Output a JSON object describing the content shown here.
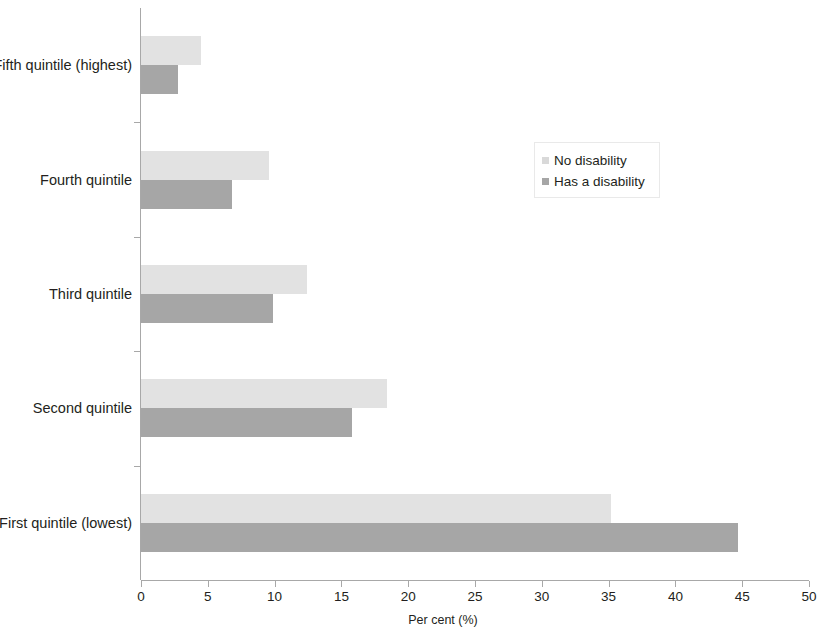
{
  "chart_data": {
    "type": "bar",
    "orientation": "horizontal",
    "title": "",
    "subtitle": "",
    "xlabel": "Per cent (%)",
    "ylabel": "",
    "xlim": [
      0,
      50
    ],
    "xticks": [
      0,
      5,
      10,
      15,
      20,
      25,
      30,
      35,
      40,
      45,
      50
    ],
    "xtick_labels": [
      "0",
      "5",
      "10",
      "15",
      "20",
      "25",
      "30",
      "35",
      "40",
      "45",
      "50"
    ],
    "grid": false,
    "legend_position": "upper right",
    "categories": [
      "Fifth quintile (highest)",
      "Fourth quintile",
      "Third quintile",
      "Second quintile",
      "First quintile (lowest)"
    ],
    "series": [
      {
        "name": "No disability",
        "color": "#e2e2e2",
        "values": [
          4.5,
          9.6,
          12.4,
          18.4,
          35.2
        ]
      },
      {
        "name": "Has a disability",
        "color": "#a6a6a6",
        "values": [
          2.8,
          6.8,
          9.9,
          15.8,
          44.7
        ]
      }
    ]
  },
  "legend": {
    "items": [
      {
        "label": "No disability",
        "swatch": "light"
      },
      {
        "label": "Has a disability",
        "swatch": "dark"
      }
    ]
  }
}
